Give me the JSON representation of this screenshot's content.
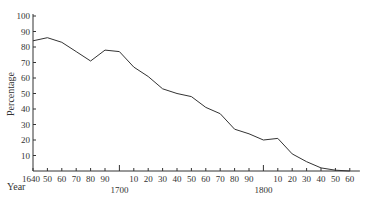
{
  "chart_data": {
    "type": "line",
    "title": "",
    "xlabel": "Year",
    "ylabel": "Percentage",
    "ylim": [
      0,
      100
    ],
    "xlim": [
      1640,
      1867
    ],
    "grid": false,
    "legend": null,
    "y_ticks": [
      10,
      20,
      30,
      40,
      50,
      60,
      70,
      80,
      90,
      100
    ],
    "x_ticks": [
      {
        "year": 1640,
        "label": "1640"
      },
      {
        "year": 1650,
        "label": "50"
      },
      {
        "year": 1660,
        "label": "60"
      },
      {
        "year": 1670,
        "label": "70"
      },
      {
        "year": 1680,
        "label": "80"
      },
      {
        "year": 1690,
        "label": "90"
      },
      {
        "year": 1700,
        "label": ""
      },
      {
        "year": 1710,
        "label": "10"
      },
      {
        "year": 1720,
        "label": "20"
      },
      {
        "year": 1730,
        "label": "30"
      },
      {
        "year": 1740,
        "label": "40"
      },
      {
        "year": 1750,
        "label": "50"
      },
      {
        "year": 1760,
        "label": "60"
      },
      {
        "year": 1770,
        "label": "70"
      },
      {
        "year": 1780,
        "label": "80"
      },
      {
        "year": 1790,
        "label": "90"
      },
      {
        "year": 1800,
        "label": ""
      },
      {
        "year": 1810,
        "label": "10"
      },
      {
        "year": 1820,
        "label": "20"
      },
      {
        "year": 1830,
        "label": "30"
      },
      {
        "year": 1840,
        "label": "40"
      },
      {
        "year": 1850,
        "label": "50"
      },
      {
        "year": 1860,
        "label": "60"
      }
    ],
    "century_labels": [
      {
        "year": 1700,
        "label": "1700"
      },
      {
        "year": 1800,
        "label": "1800"
      }
    ],
    "x": [
      1640,
      1650,
      1660,
      1670,
      1680,
      1690,
      1700,
      1710,
      1720,
      1730,
      1740,
      1750,
      1760,
      1770,
      1780,
      1790,
      1800,
      1810,
      1820,
      1830,
      1840,
      1850,
      1860
    ],
    "series": [
      {
        "name": "Percentage",
        "values": [
          84,
          86,
          83,
          77,
          71,
          78,
          77,
          67,
          61,
          53,
          50,
          48,
          41,
          37,
          27,
          24,
          20,
          21,
          11,
          6,
          2,
          0.5,
          0
        ]
      }
    ]
  }
}
